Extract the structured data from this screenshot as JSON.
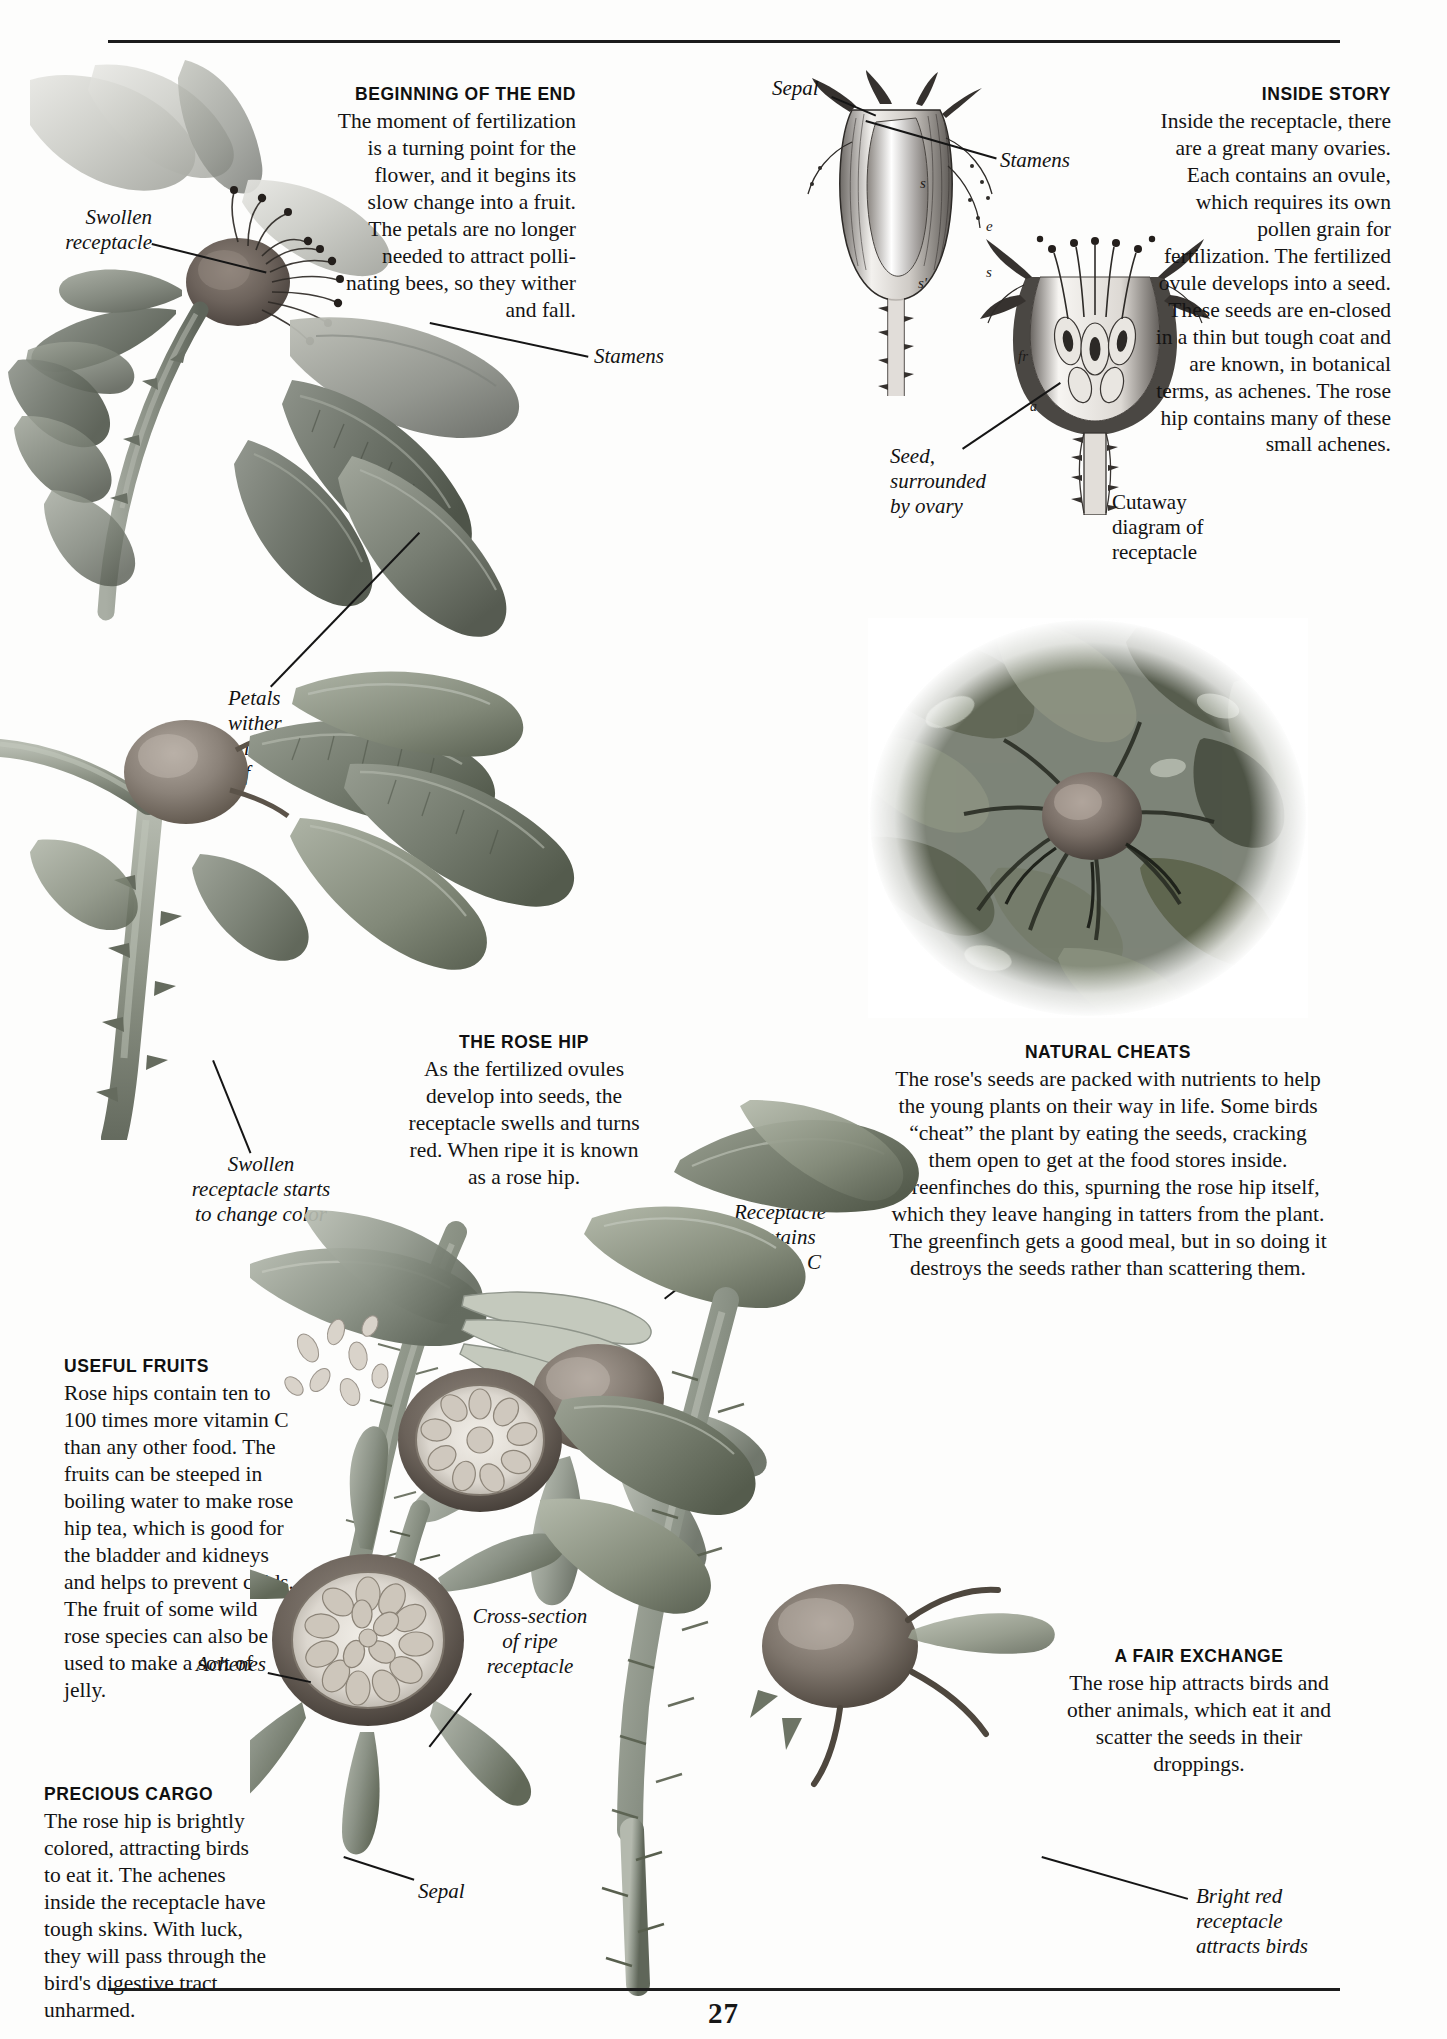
{
  "page": {
    "folio": "27"
  },
  "blocks": [
    {
      "id": "beginning-of-the-end",
      "heading": "BEGINNING OF THE END",
      "body": "The moment of fertilization is a turning point for the flower, and it begins its slow change into a fruit. The petals are no longer needed to attract polli-nating bees, so they wither and fall."
    },
    {
      "id": "inside-story",
      "heading": "INSIDE STORY",
      "body": "Inside the receptacle, there are a great many ovaries. Each contains an ovule, which requires its own pollen grain for fertilization. The fertilized ovule develops into a seed. These seeds are en-closed in a thin but tough coat and are known, in botanical terms, as  achenes. The rose hip contains many of these small achenes."
    },
    {
      "id": "the-rose-hip",
      "heading": "THE ROSE HIP",
      "body": "As the fertilized ovules develop into seeds, the receptacle swells and turns red. When ripe it is known as a rose hip."
    },
    {
      "id": "natural-cheats",
      "heading": "NATURAL CHEATS",
      "body": "The rose's seeds are packed with nutrients to help the young plants on their way in life. Some birds “cheat” the plant by eating the seeds, cracking them open to get at the food stores inside. Greenfinches do this, spurning the rose hip itself, which they leave hanging in tatters from the plant. The greenfinch gets a good meal, but in so doing it destroys the seeds rather than scattering them."
    },
    {
      "id": "useful-fruits",
      "heading": "USEFUL FRUITS",
      "body": "Rose hips contain ten to 100 times more vitamin C than any other food. The fruits  can be steeped in boiling water to make rose hip tea, which is good for the bladder and kidneys and helps to prevent colds. The fruit of some wild rose species can also be used to make a sort of jelly."
    },
    {
      "id": "a-fair-exchange",
      "heading": "A FAIR EXCHANGE",
      "body": "The rose hip attracts birds and other animals, which eat it and scatter the seeds in their droppings."
    },
    {
      "id": "precious-cargo",
      "heading": "PRECIOUS CARGO",
      "body": "The rose hip is brightly colored, attracting birds to eat it. The achenes inside the receptacle have tough skins. With luck, they will pass through the bird's digestive tract unharmed."
    }
  ],
  "captions": {
    "swollen_receptacle": "Swollen\nreceptacle",
    "stamens_photo": "Stamens",
    "petals_wither": "Petals\nwither\nand fall\noff",
    "sepal_top": "Sepal",
    "stamens_engraving": "Stamens",
    "seed_surrounded": "Seed,\nsurrounded\nby ovary",
    "cutaway": "Cutaway\ndiagram of\nreceptacle",
    "swollen_starts": "Swollen\nreceptacle starts\nto change color",
    "receptacle_vitc": "Receptacle\ncontains\nvitamin C",
    "cross_section": "Cross-section\nof ripe\nreceptacle",
    "achenes": "Achenes",
    "sepal_bottom": "Sepal",
    "bright_red": "Bright red\nreceptacle\nattracts birds"
  },
  "engraving_marks": {
    "s_upper": "s",
    "s_prime": "s'",
    "e_mark": "e",
    "s_lower": "s",
    "fr_mark": "fr",
    "a_mark": "a"
  },
  "colors": {
    "ink": "#141414",
    "rule": "#1c1c1c",
    "paper": "#fdfdfc",
    "leaf_dark": "#6f7468",
    "leaf_mid": "#9aa08e",
    "hip": "#8d8279",
    "stem": "#8f948a"
  }
}
